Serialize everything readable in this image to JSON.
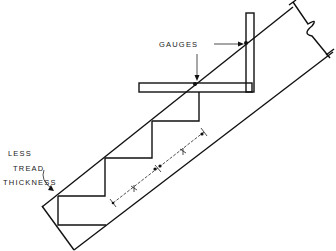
{
  "diagram": {
    "labels": {
      "gauges": "GAUGES",
      "less_line1": "LESS",
      "tread_line2": "TREAD",
      "thickness_line3": "THICKNESS"
    },
    "components": [
      "stringer-board",
      "framing-square",
      "gauges",
      "step-cutouts",
      "dimension-line",
      "break-line"
    ],
    "colors": {
      "line": "#111111",
      "background": "#ffffff"
    }
  }
}
